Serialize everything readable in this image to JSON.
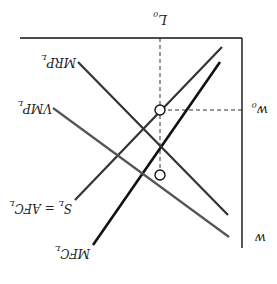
{
  "figure": {
    "orientation": "rotated 180 degrees",
    "axes": {
      "y_label": "w",
      "x_marker_label": "L",
      "x_marker_sub": "0",
      "y_marker_label": "w",
      "y_marker_sub": "0"
    },
    "curves": [
      {
        "id": "mfc",
        "label": "MFC",
        "sub": "L",
        "color": "#111111"
      },
      {
        "id": "supply",
        "label": "S",
        "sub": "L",
        "label_rest": " = AFC",
        "sub2": "L",
        "color": "#333333"
      },
      {
        "id": "vmp",
        "label": "VMP",
        "sub": "L",
        "color": "#555555"
      },
      {
        "id": "mrp",
        "label": "MRP",
        "sub": "L",
        "color": "#333333"
      }
    ],
    "points": [
      {
        "id": "upper-intersection",
        "description": "S_L meets MRP_L level"
      },
      {
        "id": "lower-intersection",
        "description": "MFC_L meets MRP_L"
      }
    ],
    "colors": {
      "axis": "#111111",
      "dashed": "#333333",
      "background": "#ffffff"
    }
  }
}
